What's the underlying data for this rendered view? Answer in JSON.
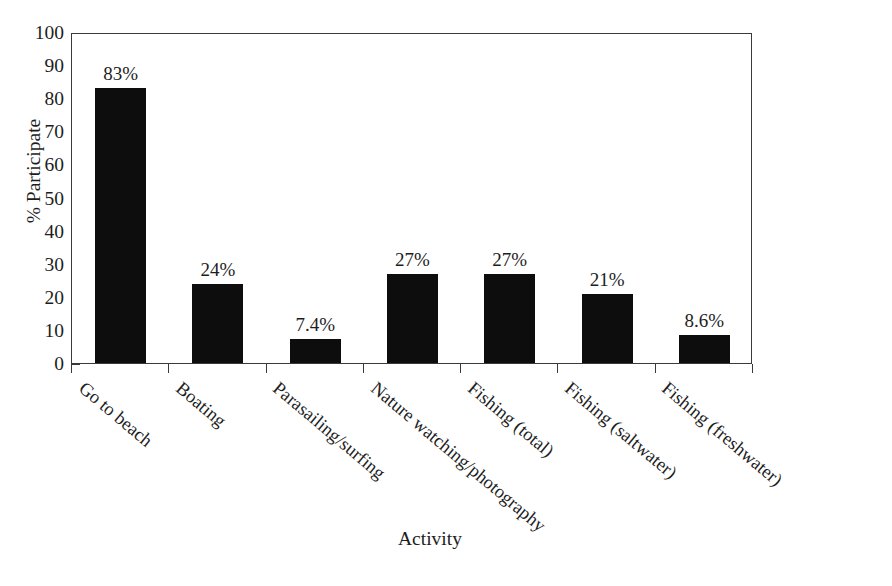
{
  "chart_data": {
    "type": "bar",
    "title": "New Jersey activities along the shore",
    "xlabel": "Activity",
    "ylabel": "% Participate",
    "categories": [
      "Go to beach",
      "Boating",
      "Parasailing/surfing",
      "Nature watching/photography",
      "Fishing (total)",
      "Fishing (saltwater)",
      "Fishing (freshwater)"
    ],
    "values": [
      83,
      24,
      7.4,
      27,
      27,
      21,
      8.6
    ],
    "value_labels": [
      "83%",
      "24%",
      "7.4%",
      "27%",
      "27%",
      "21%",
      "8.6%"
    ],
    "ylim": [
      0,
      100
    ],
    "ytick_labels": [
      "0",
      "10",
      "20",
      "30",
      "40",
      "50",
      "60",
      "70",
      "80",
      "90",
      "100"
    ],
    "ytick_values": [
      0,
      10,
      20,
      30,
      40,
      50,
      60,
      70,
      80,
      90,
      100
    ],
    "y_minor_step": 2,
    "grid": false,
    "legend": null,
    "bar_color": "#0d0d0d",
    "axis_color": "#3a3a3a",
    "background_color": "#ffffff",
    "xtick_label_rotation": -40
  }
}
